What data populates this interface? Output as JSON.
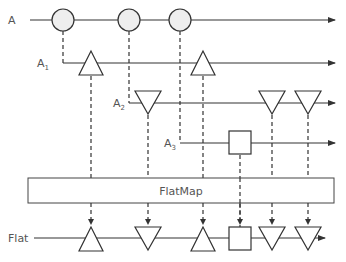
{
  "diagram": {
    "type": "marble-diagram",
    "operator_label": "FlatMap",
    "streams": [
      {
        "id": "A",
        "label": "A",
        "subscript": "",
        "y": 20,
        "x_start": 30,
        "items": [
          {
            "shape": "circle",
            "x": 63
          },
          {
            "shape": "circle",
            "x": 129
          },
          {
            "shape": "circle",
            "x": 180
          }
        ]
      },
      {
        "id": "A1",
        "label": "A",
        "subscript": "1",
        "y": 63,
        "x_start": 63,
        "items": [
          {
            "shape": "triangle-up",
            "x": 91
          },
          {
            "shape": "triangle-up",
            "x": 203
          }
        ]
      },
      {
        "id": "A2",
        "label": "A",
        "subscript": "2",
        "y": 103,
        "x_start": 129,
        "items": [
          {
            "shape": "triangle-down",
            "x": 148
          },
          {
            "shape": "triangle-down",
            "x": 272
          },
          {
            "shape": "triangle-down",
            "x": 308
          }
        ]
      },
      {
        "id": "A3",
        "label": "A",
        "subscript": "3",
        "y": 143,
        "x_start": 180,
        "items": [
          {
            "shape": "square",
            "x": 240
          }
        ]
      }
    ],
    "output": {
      "label": "Flat",
      "y": 238,
      "items": [
        {
          "shape": "triangle-up",
          "x": 91
        },
        {
          "shape": "triangle-down",
          "x": 148
        },
        {
          "shape": "triangle-up",
          "x": 203
        },
        {
          "shape": "square",
          "x": 240
        },
        {
          "shape": "triangle-down",
          "x": 272
        },
        {
          "shape": "triangle-down",
          "x": 308
        }
      ]
    },
    "colors": {
      "line": "#333333",
      "circle_fill": "#eeeeee",
      "shape_fill": "#ffffff",
      "text": "#555555"
    }
  }
}
